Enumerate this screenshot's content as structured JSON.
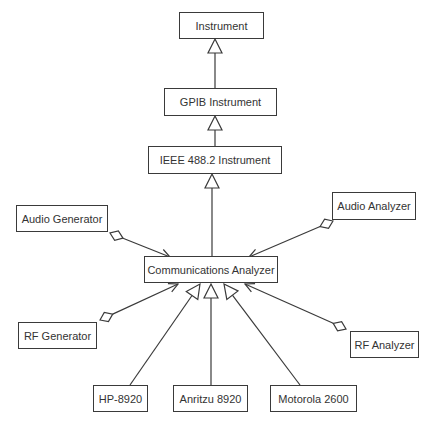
{
  "diagram": {
    "type": "uml-class-diagram",
    "classes": [
      {
        "id": "instrument",
        "label": "Instrument"
      },
      {
        "id": "gpib",
        "label": "GPIB Instrument"
      },
      {
        "id": "ieee",
        "label": "IEEE 488.2 Instrument"
      },
      {
        "id": "audio_gen",
        "label": "Audio Generator"
      },
      {
        "id": "audio_an",
        "label": "Audio Analyzer"
      },
      {
        "id": "comm",
        "label": "Communications Analyzer"
      },
      {
        "id": "rf_gen",
        "label": "RF Generator"
      },
      {
        "id": "rf_an",
        "label": "RF Analyzer"
      },
      {
        "id": "hp",
        "label": "HP-8920"
      },
      {
        "id": "anritzu",
        "label": "Anritzu 8920"
      },
      {
        "id": "motorola",
        "label": "Motorola 2600"
      }
    ],
    "relationships": [
      {
        "from": "gpib",
        "to": "instrument",
        "kind": "generalization"
      },
      {
        "from": "ieee",
        "to": "gpib",
        "kind": "generalization"
      },
      {
        "from": "comm",
        "to": "ieee",
        "kind": "generalization"
      },
      {
        "from": "hp",
        "to": "comm",
        "kind": "generalization"
      },
      {
        "from": "anritzu",
        "to": "comm",
        "kind": "generalization"
      },
      {
        "from": "motorola",
        "to": "comm",
        "kind": "generalization"
      },
      {
        "from": "audio_gen",
        "to": "comm",
        "kind": "aggregation",
        "diamond_at": "audio_gen"
      },
      {
        "from": "audio_an",
        "to": "comm",
        "kind": "aggregation",
        "diamond_at": "audio_an"
      },
      {
        "from": "rf_gen",
        "to": "comm",
        "kind": "aggregation",
        "diamond_at": "rf_gen"
      },
      {
        "from": "rf_an",
        "to": "comm",
        "kind": "aggregation",
        "diamond_at": "rf_an"
      }
    ]
  }
}
